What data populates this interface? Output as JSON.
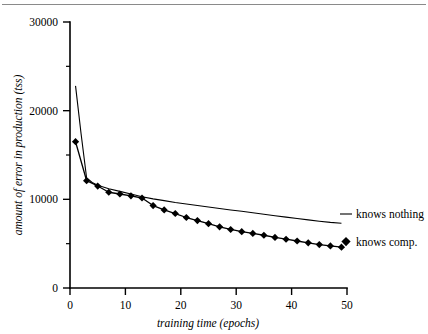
{
  "chart_data": {
    "type": "line",
    "title": "",
    "xlabel": "training time (epochs)",
    "ylabel": "amount of error in production (tss)",
    "xlim": [
      0,
      50
    ],
    "ylim": [
      0,
      30000
    ],
    "xticks": [
      0,
      10,
      20,
      30,
      40,
      50
    ],
    "xtick_labels": [
      "0",
      "10",
      "20",
      "30",
      "40",
      "50"
    ],
    "yticks": [
      0,
      10000,
      20000,
      30000
    ],
    "ytick_labels": [
      "0",
      "10000",
      "20000",
      "30000"
    ],
    "yticks_minor": [
      5000,
      15000,
      25000
    ],
    "grid": false,
    "legend_position": "right",
    "series": [
      {
        "name": "knows nothing",
        "marker": "none",
        "x": [
          1,
          2,
          3,
          4,
          5,
          7,
          9,
          11,
          13,
          15,
          17,
          19,
          21,
          23,
          25,
          27,
          29,
          31,
          33,
          35,
          37,
          39,
          41,
          43,
          45,
          47,
          49
        ],
        "values": [
          22800,
          17400,
          12400,
          11900,
          11600,
          11200,
          10900,
          10600,
          10300,
          10050,
          9850,
          9650,
          9480,
          9300,
          9130,
          8960,
          8800,
          8650,
          8480,
          8320,
          8150,
          7990,
          7830,
          7680,
          7530,
          7400,
          7300
        ]
      },
      {
        "name": "knows comp.",
        "marker": "diamond",
        "x": [
          1,
          3,
          5,
          7,
          9,
          11,
          13,
          15,
          17,
          19,
          21,
          23,
          25,
          27,
          29,
          31,
          33,
          35,
          37,
          39,
          41,
          43,
          45,
          47,
          49
        ],
        "values": [
          16500,
          12100,
          11500,
          10800,
          10600,
          10400,
          10150,
          9300,
          8800,
          8400,
          7950,
          7600,
          7250,
          6900,
          6600,
          6350,
          6150,
          5950,
          5700,
          5500,
          5300,
          5100,
          4900,
          4750,
          4600
        ]
      }
    ]
  },
  "legend": {
    "items": [
      {
        "label": "knows nothing",
        "marker": "line"
      },
      {
        "label": "knows comp.",
        "marker": "diamond"
      }
    ]
  },
  "colors": {
    "ink": "#000000",
    "rule": "#8a8a8a",
    "background": "#ffffff"
  }
}
